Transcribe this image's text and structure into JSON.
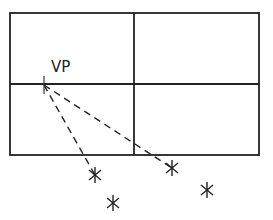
{
  "diagram": {
    "label": "VP",
    "frame": {
      "x": 10,
      "y": 13,
      "width": 249,
      "height": 142,
      "mid_x": 134,
      "mid_y": 84
    },
    "vanishing_point": {
      "x": 44,
      "y": 85
    },
    "markers": [
      {
        "x": 95,
        "y": 175
      },
      {
        "x": 113,
        "y": 203
      },
      {
        "x": 172,
        "y": 168
      },
      {
        "x": 207,
        "y": 190
      }
    ],
    "dashed_lines": [
      {
        "from": "vanishing_point",
        "to": 0
      },
      {
        "from": "vanishing_point",
        "to": 2
      }
    ],
    "stroke_color": "#222222"
  }
}
